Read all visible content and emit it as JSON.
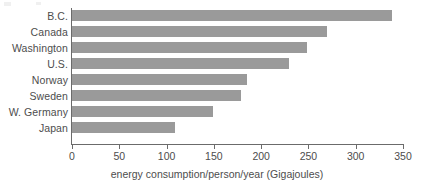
{
  "chart_data": {
    "type": "bar",
    "orientation": "horizontal",
    "title": "",
    "subtitle": "",
    "categories": [
      "B.C.",
      "Canada",
      "Washington",
      "U.S.",
      "Norway",
      "Sweden",
      "W. Germany",
      "Japan"
    ],
    "values": [
      338,
      270,
      248,
      229,
      185,
      179,
      149,
      109
    ],
    "xlabel": "energy consumption/person/year (Gigajoules)",
    "ylabel": "",
    "xlim": [
      0,
      350
    ],
    "xticks": [
      0,
      50,
      100,
      150,
      200,
      250,
      300,
      350
    ],
    "xtick_labels": [
      "0",
      "50",
      "100",
      "150",
      "200",
      "250",
      "300",
      "350"
    ],
    "grid": false,
    "legend": null,
    "legend_position": "none",
    "bar_color": "#9a9a9a",
    "axis_color": "#6b6b6b",
    "text_color": "#4d4d4d",
    "background_color": "#ffffff",
    "annotations": []
  }
}
